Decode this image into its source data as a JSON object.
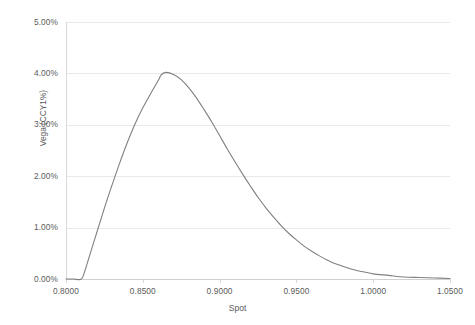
{
  "chart_data": {
    "type": "line",
    "title": "",
    "xlabel": "Spot",
    "ylabel": "Vega (CCY1%)",
    "xlim": [
      0.8,
      1.05
    ],
    "ylim": [
      0.0,
      5.0
    ],
    "grid": true,
    "legend": "none",
    "series_color": "#808080",
    "x_tick_labels": [
      "0.8000",
      "0.8500",
      "0.9000",
      "0.9500",
      "1.0000",
      "1.0500"
    ],
    "x_tick_values": [
      0.8,
      0.85,
      0.9,
      0.95,
      1.0,
      1.05
    ],
    "y_tick_labels": [
      "0.00%",
      "1.00%",
      "2.00%",
      "3.00%",
      "4.00%",
      "5.00%"
    ],
    "y_tick_values": [
      0,
      1,
      2,
      3,
      4,
      5
    ],
    "series": [
      {
        "name": "Vega",
        "x": [
          0.8,
          0.805,
          0.81,
          0.8125,
          0.815,
          0.82,
          0.825,
          0.83,
          0.835,
          0.84,
          0.845,
          0.85,
          0.855,
          0.86,
          0.862,
          0.865,
          0.87,
          0.875,
          0.88,
          0.885,
          0.89,
          0.895,
          0.9,
          0.905,
          0.91,
          0.915,
          0.92,
          0.925,
          0.93,
          0.935,
          0.94,
          0.945,
          0.95,
          0.955,
          0.96,
          0.965,
          0.97,
          0.975,
          0.98,
          0.985,
          0.99,
          0.995,
          1.0,
          1.01,
          1.02,
          1.03,
          1.04,
          1.05
        ],
        "y": [
          0.0,
          0.0,
          0.0,
          0.18,
          0.42,
          0.9,
          1.38,
          1.83,
          2.26,
          2.66,
          3.02,
          3.33,
          3.6,
          3.86,
          3.97,
          4.02,
          3.98,
          3.88,
          3.72,
          3.52,
          3.29,
          3.05,
          2.79,
          2.53,
          2.28,
          2.04,
          1.81,
          1.59,
          1.39,
          1.21,
          1.04,
          0.89,
          0.76,
          0.64,
          0.54,
          0.45,
          0.37,
          0.3,
          0.25,
          0.2,
          0.16,
          0.13,
          0.1,
          0.07,
          0.04,
          0.03,
          0.02,
          0.01
        ]
      }
    ]
  },
  "axes": {
    "x_title": "Spot",
    "y_title": "Vega (CCY1%)"
  }
}
